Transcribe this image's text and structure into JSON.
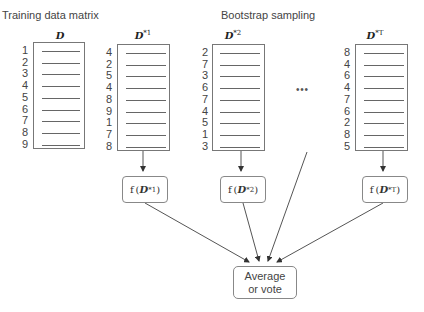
{
  "headings": {
    "training": "Training data matrix",
    "bootstrap": "Bootstrap sampling"
  },
  "matrices": [
    {
      "name": "D",
      "sup": "",
      "rows": [
        "1",
        "2",
        "3",
        "4",
        "5",
        "6",
        "7",
        "8",
        "9"
      ]
    },
    {
      "name": "D",
      "sup": "*1",
      "rows": [
        "4",
        "2",
        "5",
        "4",
        "8",
        "9",
        "1",
        "7",
        "8"
      ]
    },
    {
      "name": "D",
      "sup": "*2",
      "rows": [
        "2",
        "7",
        "3",
        "6",
        "7",
        "4",
        "5",
        "1",
        "3"
      ]
    },
    {
      "name": "D",
      "sup": "*T",
      "rows": [
        "8",
        "4",
        "6",
        "4",
        "7",
        "6",
        "2",
        "8",
        "5"
      ]
    }
  ],
  "ellipsis": "• • •",
  "models": [
    {
      "f": "f",
      "arg": "D",
      "sup": "*1"
    },
    {
      "f": "f",
      "arg": "D",
      "sup": "*2"
    },
    {
      "f": "f",
      "arg": "D",
      "sup": "*T"
    }
  ],
  "aggregate": {
    "line1": "Average",
    "line2": "or vote"
  },
  "colors": {
    "line": "#555555",
    "box_border": "#888888",
    "text": "#444444"
  }
}
